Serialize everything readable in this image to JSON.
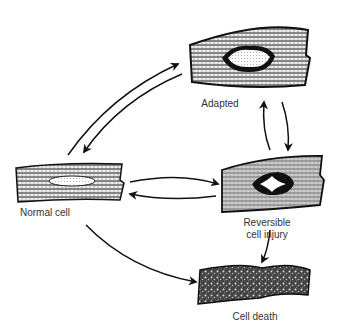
{
  "diagram": {
    "nodes": [
      {
        "id": "adapted",
        "label": "Adapted"
      },
      {
        "id": "normal",
        "label": "Normal cell"
      },
      {
        "id": "reversible",
        "label_line1": "Reversible",
        "label_line2": "cell injury"
      },
      {
        "id": "death",
        "label": "Cell death"
      }
    ],
    "edges": [
      {
        "from": "normal",
        "to": "adapted"
      },
      {
        "from": "adapted",
        "to": "normal"
      },
      {
        "from": "normal",
        "to": "reversible"
      },
      {
        "from": "reversible",
        "to": "normal"
      },
      {
        "from": "adapted",
        "to": "reversible"
      },
      {
        "from": "reversible",
        "to": "adapted"
      },
      {
        "from": "reversible",
        "to": "death"
      },
      {
        "from": "normal",
        "to": "death"
      }
    ]
  }
}
